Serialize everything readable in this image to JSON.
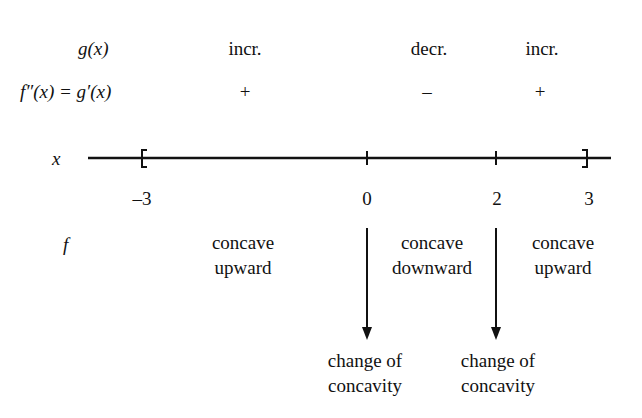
{
  "rows": {
    "g_label": "g(x)",
    "f2_label": "f″(x) = g′(x)",
    "x_label": "x",
    "f_label": "f"
  },
  "intervals": [
    {
      "g_behavior": "incr.",
      "sign": "+",
      "concavity_line1": "concave",
      "concavity_line2": "upward"
    },
    {
      "g_behavior": "decr.",
      "sign": "–",
      "concavity_line1": "concave",
      "concavity_line2": "downward"
    },
    {
      "g_behavior": "incr.",
      "sign": "+",
      "concavity_line1": "concave",
      "concavity_line2": "upward"
    }
  ],
  "number_line": {
    "ticks": [
      "–3",
      "0",
      "2",
      "3"
    ],
    "left_bracket": "[",
    "right_bracket": "]"
  },
  "annotations": [
    {
      "line1": "change of",
      "line2": "concavity",
      "at": "0"
    },
    {
      "line1": "change of",
      "line2": "concavity",
      "at": "2"
    }
  ]
}
